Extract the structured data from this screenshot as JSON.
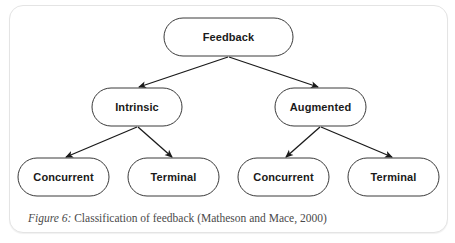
{
  "diagram": {
    "type": "tree",
    "root": {
      "id": "feedback",
      "label": "Feedback",
      "children": [
        {
          "id": "intrinsic",
          "label": "Intrinsic",
          "children": [
            {
              "id": "intrinsic-concurrent",
              "label": "Concurrent"
            },
            {
              "id": "intrinsic-terminal",
              "label": "Terminal"
            }
          ]
        },
        {
          "id": "augmented",
          "label": "Augmented",
          "children": [
            {
              "id": "augmented-concurrent",
              "label": "Concurrent"
            },
            {
              "id": "augmented-terminal",
              "label": "Terminal"
            }
          ]
        }
      ]
    },
    "nodes": {
      "feedback": "Feedback",
      "intrinsic": "Intrinsic",
      "augmented": "Augmented",
      "intrinsic_concurrent": "Concurrent",
      "intrinsic_terminal": "Terminal",
      "augmented_concurrent": "Concurrent",
      "augmented_terminal": "Terminal"
    },
    "edges": [
      {
        "from": "Feedback",
        "to": "Intrinsic"
      },
      {
        "from": "Feedback",
        "to": "Augmented"
      },
      {
        "from": "Intrinsic",
        "to": "Concurrent"
      },
      {
        "from": "Intrinsic",
        "to": "Terminal"
      },
      {
        "from": "Augmented",
        "to": "Concurrent"
      },
      {
        "from": "Augmented",
        "to": "Terminal"
      }
    ]
  },
  "caption": {
    "figure_label": "Figure 6:",
    "text": " Classification of feedback (Matheson and Mace, 2000)"
  },
  "colors": {
    "node_stroke": "#3a3a3a",
    "arrow": "#1a1a1a",
    "caption_text": "#4a4a4a",
    "frame_border": "#e4e4e4"
  }
}
